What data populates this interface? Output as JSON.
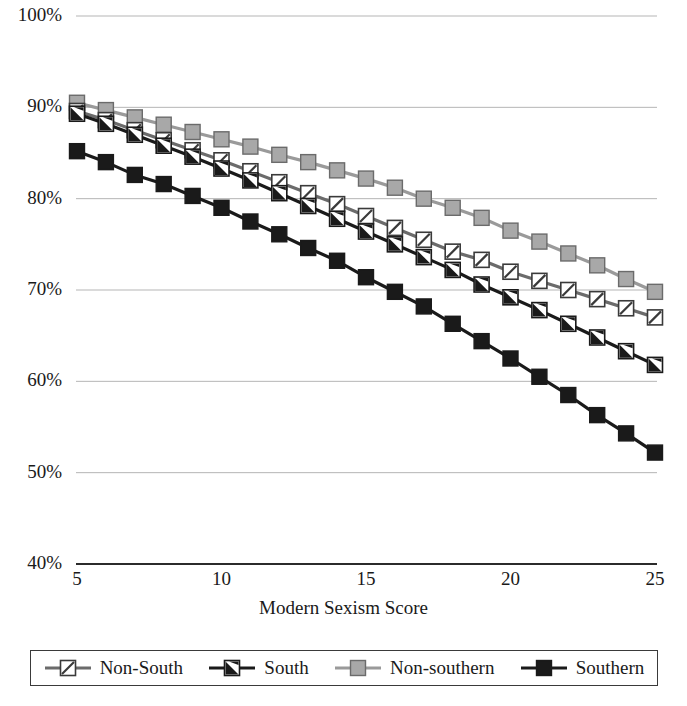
{
  "chart_data": {
    "type": "line",
    "title": "",
    "xlabel": "Modern Sexism Score",
    "ylabel": "",
    "x": [
      5,
      6,
      7,
      8,
      9,
      10,
      11,
      12,
      13,
      14,
      15,
      16,
      17,
      18,
      19,
      20,
      21,
      22,
      23,
      24,
      25
    ],
    "xlim": [
      5,
      25
    ],
    "ylim": [
      40,
      100
    ],
    "xticks": [
      "5",
      "10",
      "15",
      "20",
      "25"
    ],
    "xtick_values": [
      5,
      10,
      15,
      20,
      25
    ],
    "yticks": [
      "40%",
      "50%",
      "60%",
      "70%",
      "80%",
      "90%",
      "100%"
    ],
    "ytick_values": [
      40,
      50,
      60,
      70,
      80,
      90,
      100
    ],
    "grid": "horizontal",
    "legend_position": "bottom",
    "series": [
      {
        "name": "Non-South",
        "marker": "square-white-diagonal",
        "line_color": "#6b6b6b",
        "marker_fill": "#ffffff",
        "marker_stroke": "#3a3a3a",
        "values": [
          89.6,
          88.6,
          87.5,
          86.4,
          85.3,
          84.2,
          83.0,
          81.8,
          80.6,
          79.4,
          78.1,
          76.8,
          75.5,
          74.2,
          73.3,
          72.0,
          71.0,
          70.0,
          69.0,
          68.0,
          67.0
        ]
      },
      {
        "name": "South",
        "marker": "square-black-diagonal",
        "line_color": "#1a1a1a",
        "marker_fill": "#ffffff",
        "marker_stroke": "#1a1a1a",
        "values": [
          89.3,
          88.2,
          87.0,
          85.8,
          84.6,
          83.3,
          82.0,
          80.6,
          79.2,
          77.8,
          76.4,
          75.0,
          73.6,
          72.2,
          70.6,
          69.2,
          67.8,
          66.3,
          64.8,
          63.3,
          61.8
        ]
      },
      {
        "name": "Non-southern",
        "marker": "square-gray",
        "line_color": "#9a9a9a",
        "marker_fill": "#a8a8a8",
        "marker_stroke": "#6b6b6b",
        "values": [
          90.5,
          89.7,
          88.9,
          88.1,
          87.3,
          86.5,
          85.7,
          84.8,
          84.0,
          83.1,
          82.2,
          81.2,
          80.0,
          79.0,
          77.9,
          76.5,
          75.3,
          74.0,
          72.7,
          71.2,
          69.8
        ]
      },
      {
        "name": "Southern",
        "marker": "square-black",
        "line_color": "#1a1a1a",
        "marker_fill": "#1a1a1a",
        "marker_stroke": "#1a1a1a",
        "values": [
          85.2,
          84.0,
          82.6,
          81.6,
          80.3,
          79.0,
          77.5,
          76.1,
          74.6,
          73.2,
          71.4,
          69.8,
          68.2,
          66.3,
          64.4,
          62.5,
          60.5,
          58.5,
          56.3,
          54.3,
          52.2
        ]
      }
    ]
  }
}
